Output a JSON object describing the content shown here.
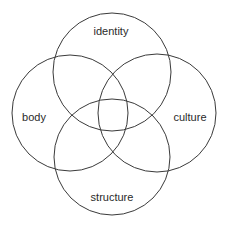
{
  "diagram": {
    "type": "venn",
    "title": "",
    "stroke_color": "#3a3a3a",
    "text_color": "#2a2a2a",
    "sets": [
      {
        "id": "identity",
        "label": "identity",
        "cx": 112,
        "cy": 72,
        "r": 59,
        "label_x": 111,
        "label_y": 32
      },
      {
        "id": "body",
        "label": "body",
        "cx": 70,
        "cy": 113,
        "r": 58,
        "label_x": 34,
        "label_y": 118
      },
      {
        "id": "culture",
        "label": "culture",
        "cx": 157,
        "cy": 113,
        "r": 59,
        "label_x": 190,
        "label_y": 118
      },
      {
        "id": "structure",
        "label": "structure",
        "cx": 112,
        "cy": 157,
        "r": 58,
        "label_x": 112,
        "label_y": 198
      }
    ]
  }
}
